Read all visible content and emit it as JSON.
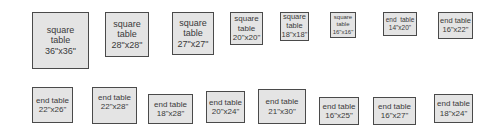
{
  "diagram": {
    "rows": [
      {
        "items": [
          {
            "line1": "square",
            "line2": "table",
            "line3": "36\"x36\""
          },
          {
            "line1": "square",
            "line2": "table",
            "line3": "28\"x28\""
          },
          {
            "line1": "square",
            "line2": "table",
            "line3": "27\"x27\""
          },
          {
            "line1": "square",
            "line2": "table",
            "line3": "20\"x20\""
          },
          {
            "line1": "square",
            "line2": "table",
            "line3": "18\"x18\""
          },
          {
            "line1": "square",
            "line2": "table",
            "line3": "16\"x16\""
          },
          {
            "line1": "end  table",
            "line2": "14\"x20\""
          },
          {
            "line1": "end table",
            "line2": "16\"x22\""
          }
        ]
      },
      {
        "items": [
          {
            "line1": "end table",
            "line2": "22\"x26\""
          },
          {
            "line1": "end table",
            "line2": "22\"x28\""
          },
          {
            "line1": "end table",
            "line2": "18\"x28\""
          },
          {
            "line1": "end table",
            "line2": "20\"x24\""
          },
          {
            "line1": "end table",
            "line2": "21\"x30\""
          },
          {
            "line1": "end table",
            "line2": "16\"x25\""
          },
          {
            "line1": "end table",
            "line2": "16\"x27\""
          },
          {
            "line1": "end table",
            "line2": "18\"x24\""
          }
        ]
      }
    ]
  }
}
